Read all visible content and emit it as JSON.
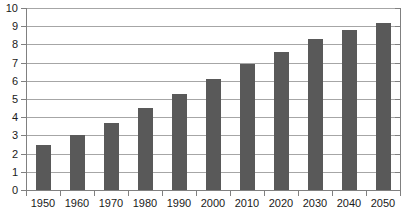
{
  "chart_data": {
    "type": "bar",
    "title": "",
    "subtitle": "",
    "xlabel": "",
    "ylabel": "",
    "categories": [
      "1950",
      "1960",
      "1970",
      "1980",
      "1990",
      "2000",
      "2010",
      "2020",
      "2030",
      "2040",
      "2050"
    ],
    "values": [
      2.5,
      3.0,
      3.7,
      4.5,
      5.3,
      6.1,
      6.9,
      7.6,
      8.3,
      8.8,
      9.2
    ],
    "ylim": [
      0,
      10
    ],
    "y_ticks": [
      "0",
      "1",
      "2",
      "3",
      "4",
      "5",
      "6",
      "7",
      "8",
      "9",
      "10"
    ],
    "grid": true,
    "legend": "none",
    "annotations": [],
    "series": [
      {
        "name": "",
        "values": [
          2.5,
          3.0,
          3.7,
          4.5,
          5.3,
          6.1,
          6.9,
          7.6,
          8.3,
          8.8,
          9.2
        ]
      }
    ]
  },
  "colors": {
    "bar": "#595959",
    "gridline": "#a6a6a6",
    "axis": "#808080",
    "text": "#1a1a1a",
    "background": "#ffffff"
  }
}
